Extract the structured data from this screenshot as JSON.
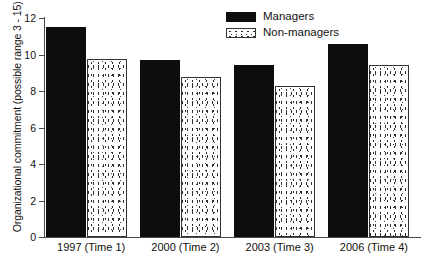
{
  "chart_data": {
    "type": "bar",
    "title": "",
    "xlabel": "",
    "ylabel": "Organizational commitment (possible range 3 - 15)",
    "ylim": [
      0,
      12
    ],
    "yticks": [
      0,
      2,
      4,
      6,
      8,
      10,
      12
    ],
    "ytick_labels": [
      "0",
      "2",
      "4",
      "6",
      "8",
      "10",
      "12"
    ],
    "grid": false,
    "legend_position": "top-center-right",
    "categories": [
      "1997 (Time 1)",
      "2000 (Time 2)",
      "2003 (Time 3)",
      "2006 (Time 4)"
    ],
    "series": [
      {
        "name": "Managers",
        "color": "#0d0d0d",
        "fill": "solid-black",
        "values": [
          11.5,
          9.7,
          9.45,
          10.6
        ]
      },
      {
        "name": "Non-managers",
        "color": "#ffffff",
        "fill": "stippled-white",
        "values": [
          9.75,
          8.75,
          8.3,
          9.45
        ]
      }
    ]
  },
  "legend": {
    "items": [
      {
        "label": "Managers",
        "swatch": "solid-black-swatch"
      },
      {
        "label": "Non-managers",
        "swatch": "stippled-white-swatch"
      }
    ]
  },
  "axes": {
    "y_title": "Organizational commitment (possible range 3 - 15)",
    "y_tick_labels": [
      "12",
      "10",
      "8",
      "6",
      "4",
      "2",
      "0"
    ],
    "x_tick_labels": [
      "1997 (Time 1)",
      "2000 (Time 2)",
      "2003 (Time 3)",
      "2006 (Time 4)"
    ]
  }
}
